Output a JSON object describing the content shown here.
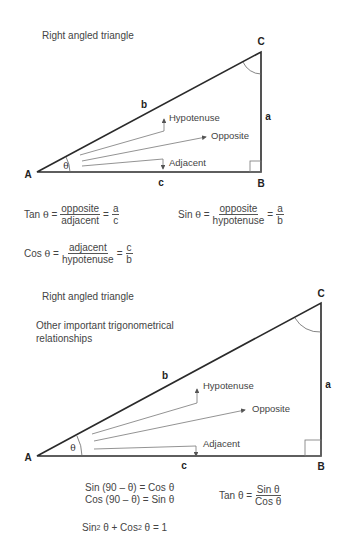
{
  "diagram1": {
    "title": "Right angled triangle",
    "vertices": {
      "A": "A",
      "B": "B",
      "C": "C"
    },
    "sides": {
      "a": "a",
      "b": "b",
      "c": "c"
    },
    "angle": "θ",
    "arrows": {
      "hypotenuse": "Hypotenuse",
      "opposite": "Opposite",
      "adjacent": "Adjacent"
    },
    "formulas": {
      "tan": {
        "lhs": "Tan",
        "theta": "θ",
        "eq": "=",
        "num": "opposite",
        "den": "adjacent",
        "eq2": "=",
        "rnum": "a",
        "rden": "c"
      },
      "sin": {
        "lhs": "Sin",
        "theta": "θ",
        "eq": "=",
        "num": "opposite",
        "den": "hypotenuse",
        "eq2": "=",
        "rnum": "a",
        "rden": "b"
      },
      "cos": {
        "lhs": "Cos",
        "theta": "θ",
        "eq": "=",
        "num": "adjacent",
        "den": "hypotenuse",
        "eq2": "=",
        "rnum": "c",
        "rden": "b"
      }
    }
  },
  "diagram2": {
    "title": "Right angled triangle",
    "subtitle_line1": "Other important trigonometrical",
    "subtitle_line2": "relationships",
    "vertices": {
      "A": "A",
      "B": "B",
      "C": "C"
    },
    "sides": {
      "a": "a",
      "b": "b",
      "c": "c"
    },
    "angle": "θ",
    "arrows": {
      "hypotenuse": "Hypotenuse",
      "opposite": "Opposite",
      "adjacent": "Adjacent"
    },
    "formulas": {
      "sin_comp": "Sin (90 – θ) = Cos θ",
      "cos_comp": "Cos (90 – θ) = Sin θ",
      "tan": {
        "lhs": "Tan θ =",
        "num": "Sin θ",
        "den": "Cos θ"
      },
      "pythag": {
        "sin": "Sin",
        "sup1": "2",
        "t1": " θ + Cos",
        "sup2": "2",
        "t2": " θ = 1"
      }
    }
  },
  "colors": {
    "line": "#2a2a2a",
    "arrow": "#666666",
    "text": "#444444"
  }
}
